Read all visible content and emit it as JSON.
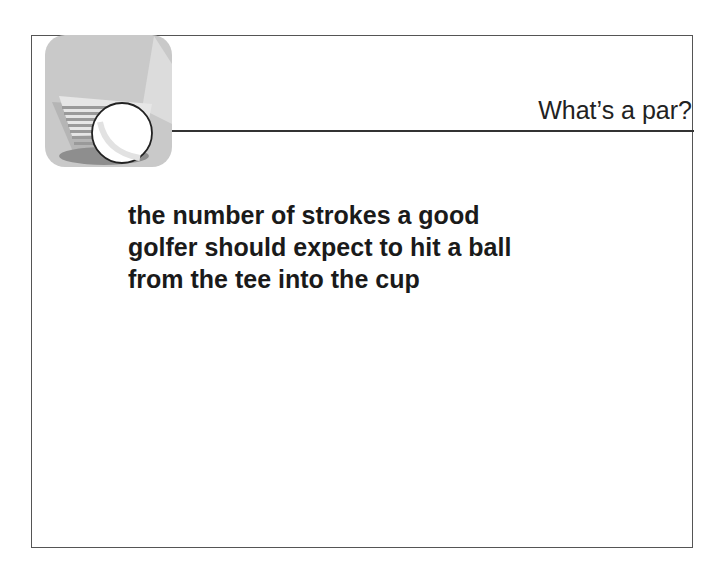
{
  "slide": {
    "title": "What’s a par?",
    "body_lines": [
      "the number of strokes a good",
      "golfer should expect to hit a ball",
      "from the tee into the cup"
    ],
    "logo_icon": "golf-club-and-ball-icon"
  },
  "colors": {
    "frame": "#555555",
    "rule": "#333333",
    "text": "#1a1a1a",
    "logo_bg": "#c8c8c8"
  }
}
